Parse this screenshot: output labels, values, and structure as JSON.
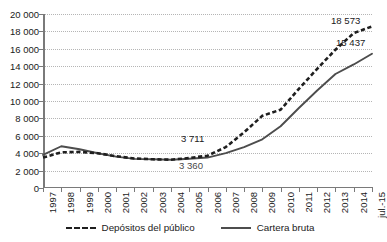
{
  "chart_data": {
    "type": "line",
    "title": "",
    "subtitle": "",
    "xlabel": "",
    "ylabel": "",
    "grid": true,
    "legend_position": "bottom",
    "ylim": [
      0,
      20000
    ],
    "ytick_step": 2000,
    "ytick_labels": [
      "20 000",
      "18 000",
      "16 000",
      "14 000",
      "12 000",
      "10 000",
      "8 000",
      "6 000",
      "4 000",
      "2 000",
      "0"
    ],
    "ytick_values": [
      20000,
      18000,
      16000,
      14000,
      12000,
      10000,
      8000,
      6000,
      4000,
      2000,
      0
    ],
    "categories": [
      "1997",
      "1998",
      "1999",
      "2000",
      "2001",
      "2002",
      "2003",
      "2004",
      "2005",
      "2006",
      "2007",
      "2008",
      "2009",
      "2010",
      "2011",
      "2012",
      "2013",
      "2014",
      "jul.-15"
    ],
    "series": [
      {
        "name": "Depósitos del público",
        "style": "dashed",
        "color": "#1f1f1f",
        "values": [
          3500,
          4100,
          4150,
          4000,
          3650,
          3400,
          3300,
          3250,
          3450,
          3711,
          4700,
          6400,
          8300,
          9000,
          11400,
          13700,
          15900,
          17800,
          18573
        ]
      },
      {
        "name": "Cartera bruta",
        "style": "solid",
        "color": "#4d4d4d",
        "values": [
          3800,
          4800,
          4450,
          4000,
          3600,
          3350,
          3300,
          3250,
          3360,
          3500,
          4000,
          4700,
          5600,
          7100,
          9200,
          11200,
          13100,
          14200,
          15437
        ]
      }
    ],
    "annotations": [
      {
        "text": "3 711",
        "series": "Depósitos del público",
        "category": "2006",
        "value": 3711
      },
      {
        "text": "3 360",
        "series": "Cartera bruta",
        "category": "2005",
        "value": 3360
      },
      {
        "text": "18 573",
        "series": "Depósitos del público",
        "category": "jul.-15",
        "value": 18573
      },
      {
        "text": "15 437",
        "series": "Cartera bruta",
        "category": "jul.-15",
        "value": 15437
      }
    ]
  },
  "legend": {
    "items": [
      {
        "label": "Depósitos del público"
      },
      {
        "label": "Cartera bruta"
      }
    ]
  },
  "labels": {
    "y": {
      "t20000": "20 000",
      "t18000": "18 000",
      "t16000": "16 000",
      "t14000": "14 000",
      "t12000": "12 000",
      "t10000": "10 000",
      "t8000": "8 000",
      "t6000": "6 000",
      "t4000": "4 000",
      "t2000": "2 000",
      "t0": "0"
    },
    "annotations": {
      "a3711": "3 711",
      "a3360": "3 360",
      "a18573": "18 573",
      "a15437": "15 437"
    }
  }
}
